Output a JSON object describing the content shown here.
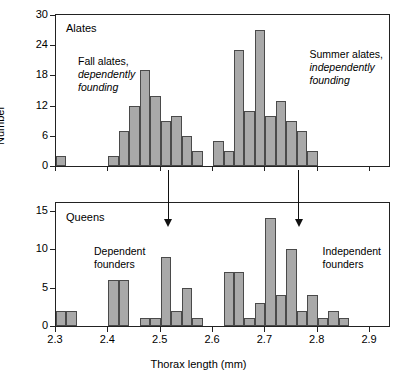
{
  "chart_data": {
    "type": "bar",
    "title": "",
    "xlabel": "Thorax length (mm)",
    "ylabel": "Number",
    "xlim": [
      2.3,
      2.94
    ],
    "bin_width": 0.02,
    "xticks": [
      "2.3",
      "2.4",
      "2.5",
      "2.6",
      "2.7",
      "2.8",
      "2.9"
    ],
    "xtick_values": [
      2.3,
      2.4,
      2.5,
      2.6,
      2.7,
      2.8,
      2.9
    ],
    "panels": [
      {
        "name": "Alates",
        "label": "Alates",
        "ylim": [
          0,
          30
        ],
        "yticks": [
          "0",
          "6",
          "12",
          "18",
          "24",
          "30"
        ],
        "ytick_values": [
          0,
          6,
          12,
          18,
          24,
          30
        ],
        "annotations": [
          {
            "line1": "Fall alates,",
            "line2": "dependently",
            "line3": "founding"
          },
          {
            "line1": "Summer alates,",
            "line2": "independently",
            "line3": "founding"
          }
        ],
        "bins": [
          2.3,
          2.32,
          2.34,
          2.36,
          2.38,
          2.4,
          2.42,
          2.44,
          2.46,
          2.48,
          2.5,
          2.52,
          2.54,
          2.56,
          2.58,
          2.6,
          2.62,
          2.64,
          2.66,
          2.68,
          2.7,
          2.72,
          2.74,
          2.76,
          2.78,
          2.8,
          2.82,
          2.84,
          2.86,
          2.88,
          2.9,
          2.92
        ],
        "values": [
          2,
          0,
          0,
          0,
          0,
          2,
          7,
          12,
          19,
          14,
          9,
          10,
          6,
          3,
          0,
          5,
          3,
          23,
          11,
          27,
          10,
          13,
          9,
          7,
          3,
          0,
          0,
          0,
          0,
          0,
          0,
          0
        ]
      },
      {
        "name": "Queens",
        "label": "Queens",
        "ylim": [
          0,
          16
        ],
        "yticks": [
          "0",
          "5",
          "10",
          "15"
        ],
        "ytick_values": [
          0,
          5,
          10,
          15
        ],
        "annotations": [
          {
            "line1": "Dependent",
            "line2": "founders"
          },
          {
            "line1": "Independent",
            "line2": "founders"
          }
        ],
        "bins": [
          2.3,
          2.32,
          2.34,
          2.36,
          2.38,
          2.4,
          2.42,
          2.44,
          2.46,
          2.48,
          2.5,
          2.52,
          2.54,
          2.56,
          2.58,
          2.6,
          2.62,
          2.64,
          2.66,
          2.68,
          2.7,
          2.72,
          2.74,
          2.76,
          2.78,
          2.8,
          2.82,
          2.84,
          2.86,
          2.88,
          2.9,
          2.92
        ],
        "values": [
          2,
          2,
          0,
          0,
          0,
          6,
          6,
          0,
          1,
          1,
          9,
          2,
          5,
          1,
          0,
          0,
          7,
          7,
          1,
          3,
          14,
          4,
          10,
          2,
          4,
          1,
          2,
          1,
          0,
          0,
          0,
          0
        ]
      }
    ],
    "arrows": [
      {
        "x": 2.515,
        "label": "arrow-dependent"
      },
      {
        "x": 2.765,
        "label": "arrow-independent"
      }
    ],
    "colors": {
      "bar_fill": "#a9a9a9",
      "bar_edge": "#4a4a4a",
      "axis": "#222222",
      "background": "#ffffff"
    }
  }
}
